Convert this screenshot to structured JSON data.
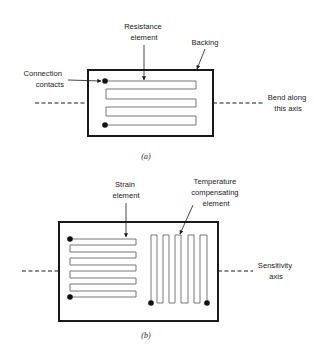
{
  "figure_a": {
    "caption": "(a)",
    "labels": {
      "resistance_element": [
        "Resistance",
        "element"
      ],
      "backing": [
        "Backing"
      ],
      "connection_contacts": [
        "Connection",
        "contacts"
      ],
      "bend_axis": [
        "Bend along",
        "this axis"
      ]
    },
    "grid_loops": 5
  },
  "figure_b": {
    "caption": "(b)",
    "labels": {
      "strain_element": [
        "Strain",
        "element"
      ],
      "temperature_element": [
        "Temperature",
        "compensating",
        "element"
      ],
      "sensitivity_axis": [
        "Sensitivity",
        "axis"
      ]
    },
    "strain_grid_loops": 9,
    "temperature_grid_loops": 9
  },
  "colors": {
    "ink": "#1a1a1a",
    "grid_line": "#6a6a6a",
    "background": "#ffffff"
  }
}
